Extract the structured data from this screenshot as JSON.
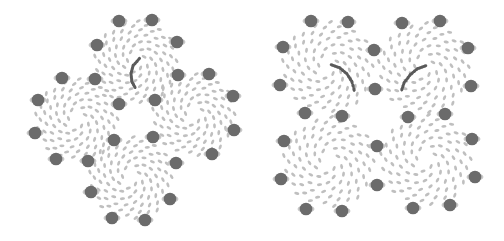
{
  "colors": {
    "background": "#ffffff",
    "ring_dot": "#6b6b6b",
    "ring_dot_halo": "#c8c8c8",
    "small_cell": "#bfbfbf",
    "highlight_arc": "#5a5a5a"
  },
  "panels": [
    {
      "name": "diamond-arrangement",
      "clusters": [
        {
          "name": "top",
          "cx": 136,
          "cy": 62,
          "r": 40
        },
        {
          "name": "left",
          "cx": 77,
          "cy": 120,
          "r": 40
        },
        {
          "name": "right",
          "cx": 194,
          "cy": 115,
          "r": 40
        },
        {
          "name": "bottom",
          "cx": 131,
          "cy": 178,
          "r": 40
        }
      ],
      "ring_dots": [
        [
          119,
          21
        ],
        [
          152,
          20
        ],
        [
          97,
          45
        ],
        [
          177,
          42
        ],
        [
          62,
          78
        ],
        [
          95,
          79
        ],
        [
          178,
          75
        ],
        [
          209,
          74
        ],
        [
          38,
          100
        ],
        [
          119,
          104
        ],
        [
          155,
          100
        ],
        [
          233,
          96
        ],
        [
          35,
          133
        ],
        [
          114,
          140
        ],
        [
          153,
          137
        ],
        [
          234,
          130
        ],
        [
          56,
          159
        ],
        [
          88,
          161
        ],
        [
          176,
          163
        ],
        [
          212,
          154
        ],
        [
          91,
          192
        ],
        [
          170,
          199
        ],
        [
          112,
          218
        ],
        [
          145,
          220
        ]
      ],
      "arcs": [
        {
          "points": [
            [
              139,
              59
            ],
            [
              133,
              66
            ],
            [
              131,
              74
            ],
            [
              132,
              82
            ],
            [
              136,
              89
            ]
          ]
        }
      ]
    },
    {
      "name": "square-arrangement",
      "clusters": [
        {
          "name": "top-left",
          "cx": 328,
          "cy": 67,
          "r": 44
        },
        {
          "name": "top-right",
          "cx": 424,
          "cy": 68,
          "r": 44
        },
        {
          "name": "bottom-left",
          "cx": 329,
          "cy": 162,
          "r": 44
        },
        {
          "name": "bottom-right",
          "cx": 426,
          "cy": 160,
          "r": 44
        }
      ],
      "ring_dots": [
        [
          311,
          21
        ],
        [
          348,
          22
        ],
        [
          402,
          23
        ],
        [
          440,
          21
        ],
        [
          283,
          47
        ],
        [
          374,
          50
        ],
        [
          468,
          48
        ],
        [
          280,
          85
        ],
        [
          375,
          89
        ],
        [
          471,
          86
        ],
        [
          305,
          113
        ],
        [
          342,
          116
        ],
        [
          408,
          117
        ],
        [
          445,
          114
        ],
        [
          284,
          141
        ],
        [
          377,
          146
        ],
        [
          472,
          139
        ],
        [
          281,
          179
        ],
        [
          377,
          185
        ],
        [
          475,
          177
        ],
        [
          306,
          209
        ],
        [
          342,
          211
        ],
        [
          413,
          208
        ],
        [
          450,
          205
        ]
      ],
      "arcs": [
        {
          "points": [
            [
              332,
              65
            ],
            [
              340,
              68
            ],
            [
              347,
              74
            ],
            [
              352,
              82
            ],
            [
              355,
              93
            ]
          ]
        },
        {
          "points": [
            [
              425,
              66
            ],
            [
              417,
              69
            ],
            [
              410,
              75
            ],
            [
              404,
              83
            ],
            [
              401,
              92
            ]
          ]
        }
      ]
    }
  ]
}
